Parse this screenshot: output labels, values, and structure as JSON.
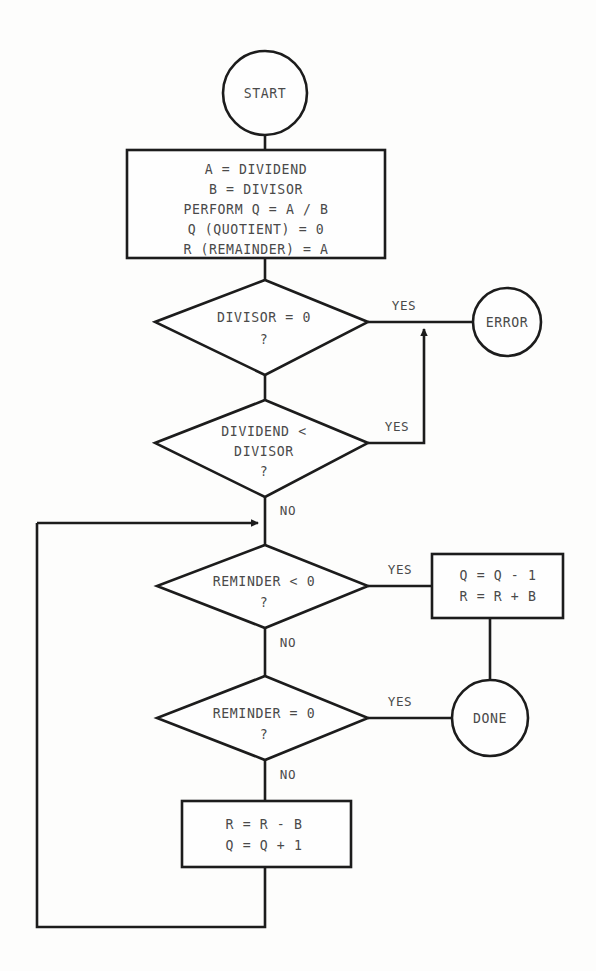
{
  "diagram": {
    "colors": {
      "background": "#fdfdfc",
      "stroke": "#1c1c1c",
      "text": "#4a4a4a",
      "shape_fill": "#fefefe"
    },
    "nodes": {
      "start": {
        "label": "START",
        "shape": "terminator-circle"
      },
      "init": {
        "shape": "process-box",
        "lines": [
          "A = DIVIDEND",
          "B = DIVISOR",
          "PERFORM Q = A / B",
          "Q (QUOTIENT) = 0",
          "R (REMAINDER) = A"
        ]
      },
      "divisor_zero": {
        "shape": "decision-diamond",
        "lines": [
          "DIVISOR = 0",
          "?"
        ]
      },
      "error": {
        "label": "ERROR",
        "shape": "terminator-circle"
      },
      "dividend_lt_divisor": {
        "shape": "decision-diamond",
        "lines": [
          "DIVIDEND <",
          "DIVISOR",
          "?"
        ]
      },
      "reminder_lt_zero": {
        "shape": "decision-diamond",
        "lines": [
          "REMINDER < 0",
          "?"
        ]
      },
      "correct_box": {
        "shape": "process-box",
        "lines": [
          "Q = Q - 1",
          "R = R + B"
        ]
      },
      "reminder_eq_zero": {
        "shape": "decision-diamond",
        "lines": [
          "REMINDER = 0",
          "?"
        ]
      },
      "done": {
        "label": "DONE",
        "shape": "terminator-circle"
      },
      "subtract_box": {
        "shape": "process-box",
        "lines": [
          "R = R - B",
          "Q = Q + 1"
        ]
      }
    },
    "edge_labels": {
      "divisor_zero_yes": "YES",
      "dividend_lt_divisor_yes": "YES",
      "dividend_lt_divisor_no": "NO",
      "reminder_lt_zero_yes": "YES",
      "reminder_lt_zero_no": "NO",
      "reminder_eq_zero_yes": "YES",
      "reminder_eq_zero_no": "NO"
    }
  }
}
